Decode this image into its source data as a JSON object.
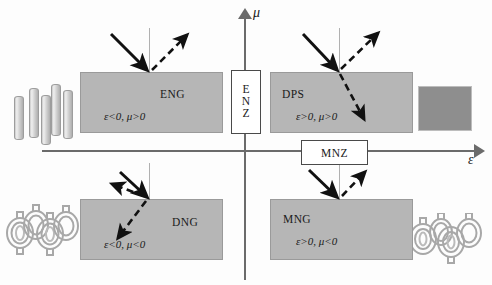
{
  "diagram": {
    "type": "quadrant-classification",
    "axes": {
      "x_label": "ε",
      "y_label": "μ",
      "x_name": "permittivity",
      "y_name": "permeability"
    },
    "center_labels": [
      {
        "id": "enz",
        "text": [
          "E",
          "N",
          "Z"
        ],
        "full": "ENZ",
        "meaning": "epsilon-near-zero",
        "placement": "on-vertical-axis"
      },
      {
        "id": "mnz",
        "text": "MNZ",
        "meaning": "mu-near-zero",
        "placement": "on-horizontal-axis"
      }
    ],
    "quadrants": [
      {
        "id": "eng",
        "name": "ENG",
        "condition": "ε<0, μ>0",
        "quadrant": "upper-left",
        "inclusion": "metallic-rods",
        "rays": {
          "incident": true,
          "reflected": true,
          "transmitted": false
        }
      },
      {
        "id": "dps",
        "name": "DPS",
        "condition": "ε>0, μ>0",
        "quadrant": "upper-right",
        "inclusion": "solid-dielectric-block",
        "rays": {
          "incident": true,
          "reflected": true,
          "transmitted": true,
          "refraction": "positive"
        }
      },
      {
        "id": "dng",
        "name": "DNG",
        "condition": "ε<0, μ<0",
        "quadrant": "lower-left",
        "inclusion": "split-ring-resonators",
        "rays": {
          "incident": true,
          "reflected": true,
          "transmitted": true,
          "refraction": "negative"
        }
      },
      {
        "id": "mng",
        "name": "MNG",
        "condition": "ε>0, μ<0",
        "quadrant": "lower-right",
        "inclusion": "split-ring-resonators",
        "rays": {
          "incident": true,
          "reflected": true,
          "transmitted": false
        }
      }
    ],
    "colors": {
      "slab_fill": "#b6b6b6",
      "axis": "#6b6b6b",
      "ray_solid": "#111111",
      "ray_dashed": "#111111",
      "normal_line": "#b0b0b0",
      "solid_block": "#8e8e8e",
      "background": "#fdfdfd"
    }
  }
}
